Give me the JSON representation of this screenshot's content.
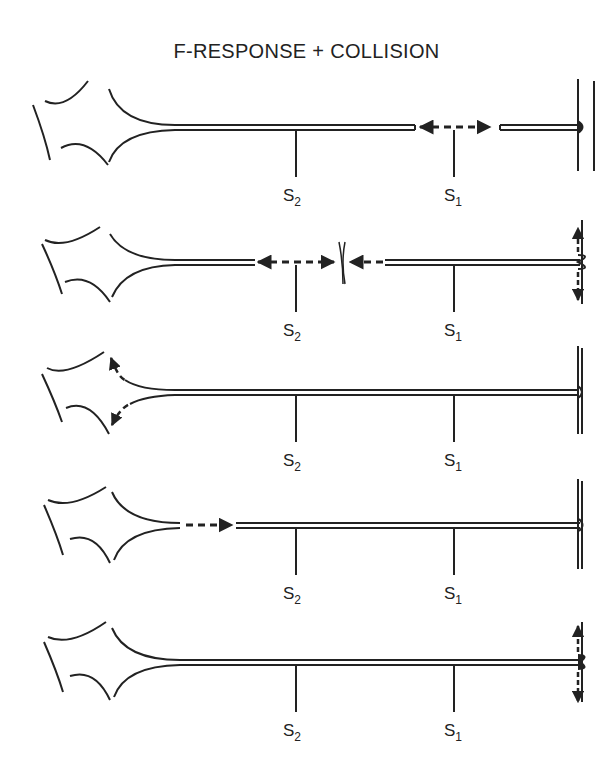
{
  "title": "F-RESPONSE + COLLISION",
  "colors": {
    "ink": "#222222",
    "background": "#ffffff"
  },
  "panels": [
    {
      "stage": 1,
      "description": "Antidromic impulses from S1 travel in both directions",
      "s2": {
        "letter": "S",
        "sub": "2"
      },
      "s1": {
        "letter": "S",
        "sub": "1"
      }
    },
    {
      "stage": 2,
      "description": "Collision between antidromic S2 impulse and orthodromic impulse; end-plate activation at muscle",
      "s2": {
        "letter": "S",
        "sub": "2"
      },
      "s1": {
        "letter": "S",
        "sub": "1"
      }
    },
    {
      "stage": 3,
      "description": "Impulse reaches cell body (anterior horn cell)",
      "s2": {
        "letter": "S",
        "sub": "2"
      },
      "s1": {
        "letter": "S",
        "sub": "1"
      }
    },
    {
      "stage": 4,
      "description": "F-response travels orthodromically down the axon",
      "s2": {
        "letter": "S",
        "sub": "2"
      },
      "s1": {
        "letter": "S",
        "sub": "1"
      }
    },
    {
      "stage": 5,
      "description": "F-response reaches muscle end-plate",
      "s2": {
        "letter": "S",
        "sub": "2"
      },
      "s1": {
        "letter": "S",
        "sub": "1"
      }
    }
  ]
}
